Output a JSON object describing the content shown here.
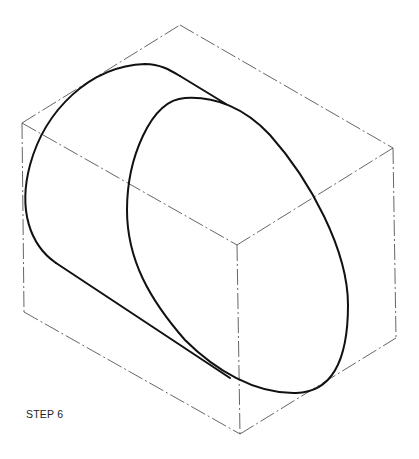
{
  "figure": {
    "label": "STEP 6"
  },
  "colors": {
    "box_line": "#555555",
    "curve_line": "#111111",
    "background": "#ffffff"
  }
}
